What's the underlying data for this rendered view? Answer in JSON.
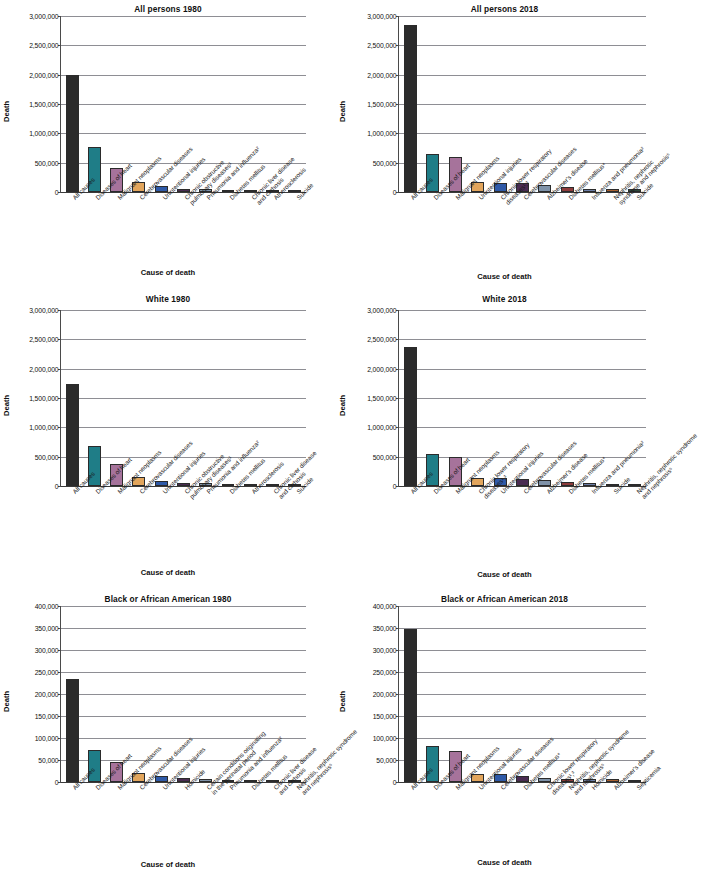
{
  "figure": {
    "axis_titles": {
      "y": "Death",
      "x": "Cause of death"
    },
    "palette": [
      "#2b2b2b",
      "#1f7d87",
      "#a6739b",
      "#e2a55c",
      "#2f5aa8",
      "#4a2c52",
      "#7f92a8",
      "#8e3b3b",
      "#6d7fa8",
      "#a8602f",
      "#2f4a3a"
    ]
  },
  "chart_data": [
    {
      "type": "bar",
      "title": "All persons 1980",
      "xlabel": "Cause of death",
      "ylabel": "Death",
      "ylim": [
        0,
        3000000
      ],
      "ytick_labels": [
        "0",
        "500,000",
        "1,000,000",
        "1,500,000",
        "2,000,000",
        "2,500,000",
        "3,000,000"
      ],
      "ytick_values": [
        0,
        500000,
        1000000,
        1500000,
        2000000,
        2500000,
        3000000
      ],
      "grid": true,
      "legend": "none",
      "categories": [
        "All causes",
        "Diseases of heart",
        "Malignant neoplasms",
        "Cerebrovascular diseases",
        "Unintentional injuries",
        "Chronic obstructive\npulmonary diseases¹",
        "Pneumonia and influenza²",
        "Diabetes mellitus",
        "Chronic liver disease\nand cirrhosis",
        "Atherosclerosis",
        "Suicide"
      ],
      "values": [
        1989841,
        761085,
        416509,
        170225,
        105718,
        56050,
        54619,
        34851,
        30583,
        29449,
        26869
      ]
    },
    {
      "type": "bar",
      "title": "All persons 2018",
      "xlabel": "Cause of death",
      "ylabel": "Death",
      "ylim": [
        0,
        3000000
      ],
      "ytick_labels": [
        "0",
        "500,000",
        "1,000,000",
        "1,500,000",
        "2,000,000",
        "2,500,000",
        "3,000,000"
      ],
      "ytick_values": [
        0,
        500000,
        1000000,
        1500000,
        2000000,
        2500000,
        3000000
      ],
      "grid": true,
      "legend": "none",
      "categories": [
        "All causes",
        "Diseases of heart",
        "Malignant neoplasms",
        "Unintentional injuries",
        "Chronic lower respiratory\ndiseases¹,³",
        "Cerebrovascular diseases",
        "Alzheimer's disease",
        "Diabetes mellitus⁴",
        "Influenza and pneumonia²",
        "Nephritis, nephrotic\nsyndrome and nephrosis⁵",
        "Suicide"
      ],
      "values": [
        2839205,
        655381,
        599274,
        167127,
        159486,
        147810,
        122019,
        84946,
        59120,
        51386,
        48344
      ]
    },
    {
      "type": "bar",
      "title": "White 1980",
      "xlabel": "Cause of death",
      "ylabel": "Death",
      "ylim": [
        0,
        3000000
      ],
      "ytick_labels": [
        "0",
        "500,000",
        "1,000,000",
        "1,500,000",
        "2,000,000",
        "2,500,000",
        "3,000,000"
      ],
      "ytick_values": [
        0,
        500000,
        1000000,
        1500000,
        2000000,
        2500000,
        3000000
      ],
      "grid": true,
      "legend": "none",
      "categories": [
        "All causes",
        "Diseases of heart",
        "Malignant neoplasms",
        "Cerebrovascular diseases",
        "Unintentional injuries",
        "Chronic obstructive\npulmonary diseases¹",
        "Pneumonia and influenza²",
        "Diabetes mellitus",
        "Atherosclerosis",
        "Chronic liver disease\nand cirrhosis",
        "Suicide"
      ],
      "values": [
        1738607,
        683347,
        368162,
        148734,
        90122,
        52375,
        48369,
        28868,
        27069,
        24829,
        24829
      ]
    },
    {
      "type": "bar",
      "title": "White 2018",
      "xlabel": "Cause of death",
      "ylabel": "Death",
      "ylim": [
        0,
        3000000
      ],
      "ytick_labels": [
        "0",
        "500,000",
        "1,000,000",
        "1,500,000",
        "2,000,000",
        "2,500,000",
        "3,000,000"
      ],
      "ytick_values": [
        0,
        500000,
        1000000,
        1500000,
        2000000,
        2500000,
        3000000
      ],
      "grid": true,
      "legend": "none",
      "categories": [
        "All causes",
        "Diseases of heart",
        "Malignant neoplasms",
        "Chronic lower respiratory\ndiseases¹,³",
        "Unintentional injuries",
        "Cerebrovascular diseases",
        "Alzheimer's disease",
        "Diabetes mellitus⁴",
        "Influenza and pneumonia²",
        "Suicide",
        "Nephritis, nephrotic syndrome\nand nephrosis⁵"
      ],
      "values": [
        2375876,
        542517,
        496773,
        136848,
        133960,
        115697,
        103842,
        62521,
        48768,
        42701,
        37582
      ]
    },
    {
      "type": "bar",
      "title": "Black or African American 1980",
      "xlabel": "Cause of death",
      "ylabel": "Death",
      "ylim": [
        0,
        400000
      ],
      "ytick_labels": [
        "0",
        "50,000",
        "100,000",
        "150,000",
        "200,000",
        "250,000",
        "300,000",
        "350,000",
        "400,000"
      ],
      "ytick_values": [
        0,
        50000,
        100000,
        150000,
        200000,
        250000,
        300000,
        350000,
        400000
      ],
      "grid": true,
      "legend": "none",
      "categories": [
        "All causes",
        "Diseases of heart",
        "Malignant neoplasms",
        "Cerebrovascular diseases",
        "Unintentional injuries",
        "Homicide",
        "Certain conditions originating\nin the perinatal period",
        "Pneumonia and influenza²",
        "Diabetes mellitus",
        "Chronic liver disease\nand cirrhosis",
        "Nephritis, nephrotic syndrome\nand nephrosis⁵"
      ],
      "values": [
        233135,
        72956,
        45037,
        20135,
        14072,
        10172,
        6961,
        5648,
        5544,
        4790,
        3416
      ]
    },
    {
      "type": "bar",
      "title": "Black or African American 2018",
      "xlabel": "Cause of death",
      "ylabel": "Death",
      "ylim": [
        0,
        400000
      ],
      "ytick_labels": [
        "0",
        "50,000",
        "100,000",
        "150,000",
        "200,000",
        "250,000",
        "300,000",
        "350,000",
        "400,000"
      ],
      "ytick_values": [
        0,
        50000,
        100000,
        150000,
        200000,
        250000,
        300000,
        350000,
        400000
      ],
      "grid": true,
      "legend": "none",
      "categories": [
        "All causes",
        "Diseases of heart",
        "Malignant neoplasms",
        "Unintentional injuries",
        "Cerebrovascular diseases",
        "Diabetes mellitus⁴",
        "Chronic lower respiratory\ndiseases¹,³",
        "Nephritis, nephrotic syndrome\nand nephrosis⁵",
        "Homicide",
        "Alzheimer's disease",
        "Septicemia"
      ],
      "values": [
        347827,
        81038,
        70239,
        19263,
        18454,
        14007,
        9489,
        7662,
        7457,
        6594,
        4425
      ]
    }
  ]
}
